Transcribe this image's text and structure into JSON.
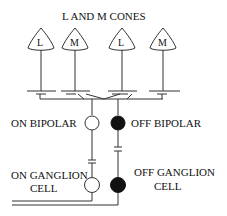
{
  "title": "L AND M CONES",
  "cones": [
    {
      "label": "L",
      "x": 41
    },
    {
      "label": "M",
      "x": 75
    },
    {
      "label": "L",
      "x": 122
    },
    {
      "label": "M",
      "x": 163
    }
  ],
  "bipolars": {
    "on_label": "ON BIPOLAR",
    "off_label": "OFF BIPOLAR"
  },
  "ganglions": {
    "on_label_line1": "ON GANGLION",
    "on_label_line2": "CELL",
    "off_label_line1": "OFF GANGLION",
    "off_label_line2": "CELL"
  },
  "colors": {
    "on_cell": "#ffffff",
    "off_cell": "#111111",
    "line": "#333333"
  }
}
